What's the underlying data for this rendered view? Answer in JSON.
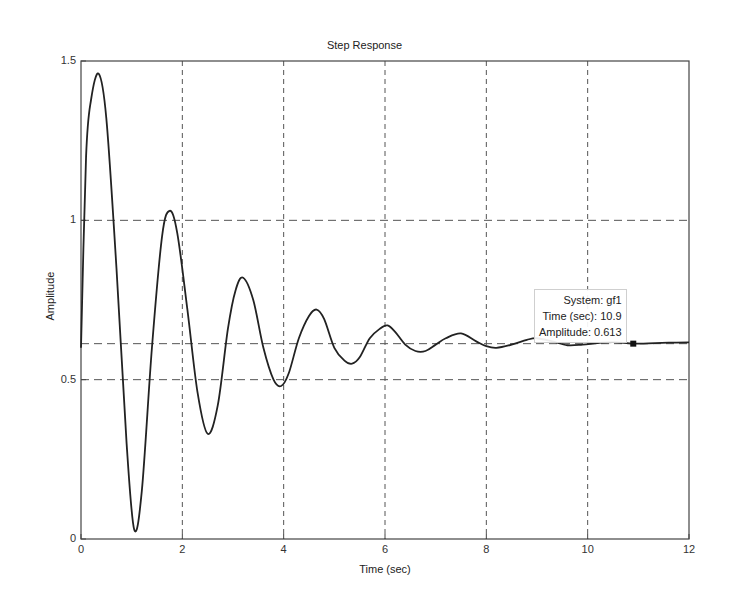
{
  "chart_data": {
    "type": "line",
    "title": "Step Response",
    "xlabel": "Time (sec)",
    "ylabel": "Amplitude",
    "xlim": [
      0,
      12
    ],
    "ylim": [
      0,
      1.5
    ],
    "grid": true,
    "x_ticks": [
      "0",
      "2",
      "4",
      "6",
      "8",
      "10",
      "12"
    ],
    "y_ticks": [
      "0",
      "0.5",
      "1",
      "1.5"
    ],
    "steady_state_reference": 0.613,
    "series": [
      {
        "name": "gf1",
        "x": [
          0,
          0.1,
          0.2,
          0.35,
          0.5,
          0.7,
          0.9,
          1.05,
          1.2,
          1.4,
          1.6,
          1.75,
          1.9,
          2.1,
          2.3,
          2.5,
          2.7,
          2.9,
          3.05,
          3.2,
          3.4,
          3.6,
          3.8,
          3.95,
          4.1,
          4.3,
          4.5,
          4.65,
          4.8,
          5.0,
          5.2,
          5.35,
          5.5,
          5.7,
          5.9,
          6.05,
          6.2,
          6.4,
          6.6,
          6.8,
          7.0,
          7.2,
          7.5,
          7.8,
          8.0,
          8.2,
          8.5,
          8.8,
          9.0,
          9.3,
          9.6,
          9.9,
          10.2,
          10.5,
          10.9,
          11.2,
          11.6,
          12.0
        ],
        "y": [
          0.6,
          1.2,
          1.38,
          1.46,
          1.32,
          0.85,
          0.3,
          0.03,
          0.15,
          0.6,
          0.95,
          1.03,
          0.96,
          0.72,
          0.46,
          0.33,
          0.42,
          0.66,
          0.78,
          0.82,
          0.75,
          0.6,
          0.5,
          0.48,
          0.52,
          0.63,
          0.7,
          0.72,
          0.69,
          0.6,
          0.56,
          0.55,
          0.57,
          0.63,
          0.66,
          0.67,
          0.65,
          0.61,
          0.59,
          0.59,
          0.61,
          0.63,
          0.645,
          0.62,
          0.605,
          0.6,
          0.61,
          0.625,
          0.63,
          0.62,
          0.608,
          0.61,
          0.615,
          0.618,
          0.613,
          0.614,
          0.616,
          0.617
        ]
      }
    ],
    "datatip": {
      "system": "System: gf1",
      "time": "Time (sec): 10.9",
      "amplitude": "Amplitude: 0.613",
      "x": 10.9,
      "y": 0.613
    }
  }
}
